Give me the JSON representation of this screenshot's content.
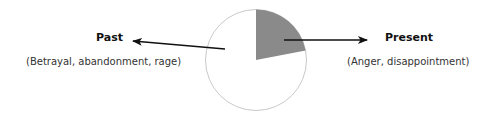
{
  "chart_data": {
    "type": "pie",
    "title": "",
    "slices": [
      {
        "name": "Present",
        "fraction": 0.22,
        "color": "#8a8a8a"
      },
      {
        "name": "Past",
        "fraction": 0.78,
        "color": "#ffffff"
      }
    ],
    "annotations": [
      {
        "target": "Past",
        "title": "Past",
        "subtitle": "(Betrayal, abandonment, rage)",
        "side": "left"
      },
      {
        "target": "Present",
        "title": "Present",
        "subtitle": "(Anger, disappointment)",
        "side": "right"
      }
    ]
  },
  "colors": {
    "outline": "#bbbbbb",
    "arrow": "#111111",
    "present_fill": "#8a8a8a"
  }
}
